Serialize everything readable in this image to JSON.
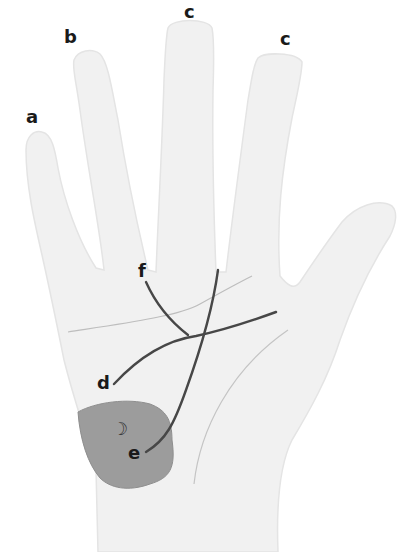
{
  "diagram": {
    "type": "palmistry-hand",
    "colors": {
      "background": "#ffffff",
      "hand_fill": "#f1f1f1",
      "hand_outline": "#e2e2e2",
      "crease": "#b8b8b8",
      "line": "#4a4a4a",
      "mount_fill": "#9a9a9a",
      "label": "#1a1a1a"
    },
    "labels": {
      "a": "a",
      "b": "b",
      "c1": "c",
      "c2": "c",
      "d": "d",
      "e": "e",
      "f": "f"
    },
    "symbols": {
      "moon": "☽"
    }
  }
}
